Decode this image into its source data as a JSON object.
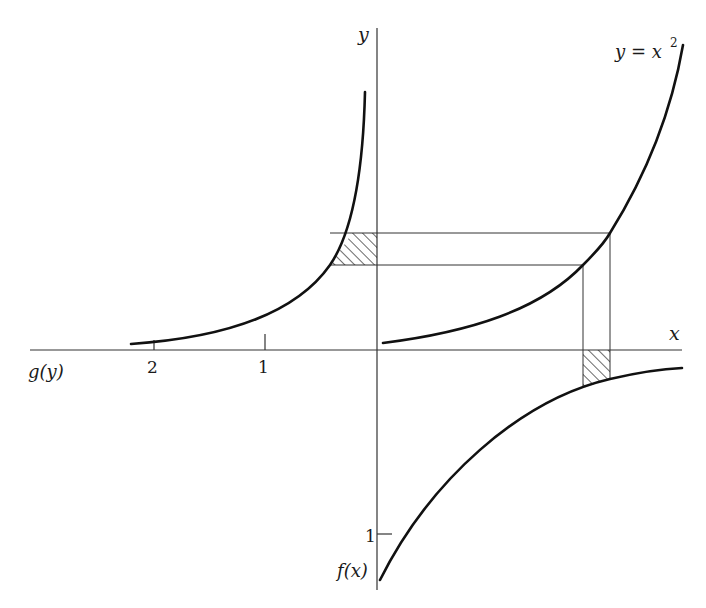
{
  "diagram": {
    "axes": {
      "x_label": "x",
      "y_label": "y",
      "left_axis_label": "g(y)",
      "bottom_axis_label": "f(x)"
    },
    "curves": {
      "top_right": {
        "label": "y = x",
        "exponent": "2"
      },
      "top_left": {
        "label": "g(y)"
      },
      "bottom_right": {
        "label": "f(x)"
      }
    },
    "ticks": {
      "left_axis": [
        {
          "label": "2"
        },
        {
          "label": "1"
        }
      ],
      "bottom_axis": [
        {
          "label": "1"
        }
      ]
    },
    "colors": {
      "line": "#1a1a1a",
      "background": "#ffffff"
    }
  }
}
